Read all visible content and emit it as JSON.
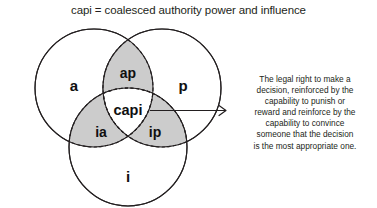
{
  "title": "capi = coalesced authority power and influence",
  "diagram": {
    "type": "venn-3-circle",
    "circles": [
      {
        "key": "a",
        "label": "a",
        "name": "authority",
        "position": "upper-left",
        "fill": "#ffffff",
        "stroke": "#231f20"
      },
      {
        "key": "p",
        "label": "p",
        "name": "power",
        "position": "upper-right",
        "fill": "#ffffff",
        "stroke": "#231f20"
      },
      {
        "key": "i",
        "label": "i",
        "name": "influence",
        "position": "bottom",
        "fill": "#ffffff",
        "stroke": "#231f20"
      }
    ],
    "intersections": [
      {
        "key": "ap",
        "label": "ap",
        "between": [
          "a",
          "p"
        ],
        "position": "top",
        "fill": "#cccccc",
        "border": "dashed"
      },
      {
        "key": "ia",
        "label": "ia",
        "between": [
          "i",
          "a"
        ],
        "position": "lower-left",
        "fill": "#cccccc",
        "border": "dashed"
      },
      {
        "key": "ip",
        "label": "ip",
        "between": [
          "i",
          "p"
        ],
        "position": "lower-right",
        "fill": "#cccccc",
        "border": "dashed"
      }
    ],
    "center": {
      "key": "capi",
      "label": "capi",
      "fill": "#ffffff",
      "border": "dashed"
    },
    "arrow": {
      "from": "capi",
      "to": "description",
      "direction": "right",
      "color": "#231f20"
    }
  },
  "description": {
    "lines": [
      "The legal right to make a",
      "decision, reinforced by the",
      "capability to punish or",
      "reward and reinforce by the",
      "capability to convince",
      "someone that the decision",
      "is the most appropriate one."
    ]
  },
  "colors": {
    "background": "#ffffff",
    "stroke": "#231f20",
    "shade": "#cccccc",
    "text": "#231f20"
  }
}
